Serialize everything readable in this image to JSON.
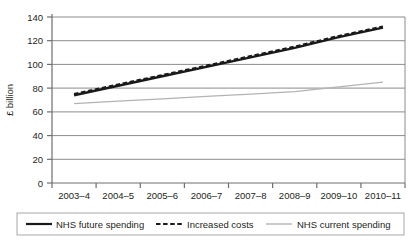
{
  "chart_data": {
    "type": "line",
    "title": "",
    "xlabel": "",
    "ylabel": "£ billion",
    "ylim": [
      0,
      140
    ],
    "yticks": [
      0,
      20,
      40,
      60,
      80,
      100,
      120,
      140
    ],
    "grid": true,
    "legend_position": "bottom",
    "categories": [
      "2003–4",
      "2004–5",
      "2005–6",
      "2006–7",
      "2007–8",
      "2008–9",
      "2009–10",
      "2010–11"
    ],
    "series": [
      {
        "name": "NHS future spending",
        "style": "solid",
        "color": "#1a1a1a",
        "values": [
          74,
          82,
          90,
          98,
          106,
          114,
          123,
          131
        ]
      },
      {
        "name": "Increased costs",
        "style": "dashed",
        "color": "#1a1a1a",
        "values": [
          75,
          83,
          91,
          99,
          107,
          115,
          124,
          132
        ]
      },
      {
        "name": "NHS current spending",
        "style": "solid",
        "color": "#b3b3b3",
        "values": [
          67,
          69,
          71,
          73,
          75,
          77,
          81,
          85
        ]
      }
    ]
  },
  "axes": {
    "y_title": "£ billion",
    "y_tick_labels": [
      "140",
      "120",
      "100",
      "80",
      "60",
      "40",
      "20",
      "0"
    ],
    "x_tick_labels": [
      "2003–4",
      "2004–5",
      "2005–6",
      "2006–7",
      "2007–8",
      "2008–9",
      "2009–10",
      "2010–11"
    ]
  },
  "legend": {
    "items": [
      {
        "label": "NHS future spending",
        "swatch": "solid-black-line"
      },
      {
        "label": "Increased costs",
        "swatch": "dashed-black-line"
      },
      {
        "label": "NHS current spending",
        "swatch": "solid-grey-line"
      }
    ]
  },
  "colors": {
    "series_dark": "#1a1a1a",
    "series_grey": "#b3b3b3",
    "gridline": "#8c8c8c",
    "axis": "#6e6e6e",
    "legend_border": "#a8a8a8",
    "background": "#ffffff"
  }
}
